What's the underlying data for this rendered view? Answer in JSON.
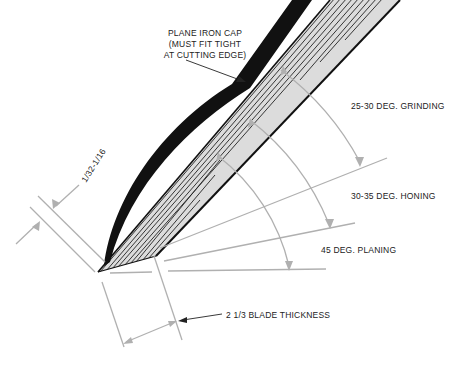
{
  "diagram": {
    "labels": {
      "cap_line1": "PLANE IRON CAP",
      "cap_line2": "(MUST FIT TIGHT",
      "cap_line3": "AT CUTTING EDGE)",
      "grinding": "25-30 DEG. GRINDING",
      "honing": "30-35 DEG. HONING",
      "planing": "45 DEG. PLANING",
      "cap_gap": "1/32-1/16",
      "blade_thickness": "2 1/3 BLADE THICKNESS"
    },
    "colors": {
      "ink": "#111111",
      "dimension_lines": "#b0b0b0",
      "bevel_fill": "#d9d9d9",
      "background": "#ffffff"
    }
  }
}
